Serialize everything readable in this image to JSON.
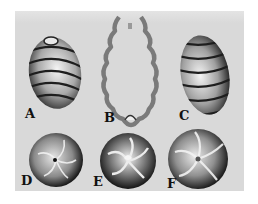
{
  "plate": {
    "background": "#d9d9d9",
    "figures": [
      {
        "id": "A",
        "label": "A",
        "description": "ovoid body with sinistral spiral bands, side view"
      },
      {
        "id": "B",
        "label": "B",
        "description": "longitudinal section outline with wavy wall"
      },
      {
        "id": "C",
        "label": "C",
        "description": "ovoid body with spiral bands, side view"
      },
      {
        "id": "D",
        "label": "D",
        "description": "apical view, spiral cells with small central pore"
      },
      {
        "id": "E",
        "label": "E",
        "description": "apical view, spiral cells, dark rim"
      },
      {
        "id": "F",
        "label": "F",
        "description": "apical view, spiral cells"
      }
    ]
  }
}
